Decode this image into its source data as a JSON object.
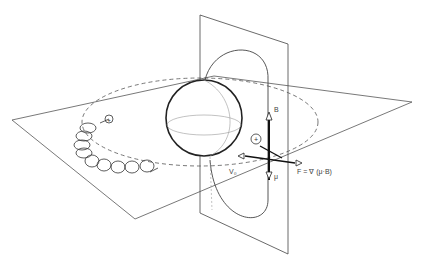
{
  "diagram": {
    "type": "magnetic-mirror-force-illustration",
    "labels": {
      "B": "B",
      "mu": "μ",
      "v0": "V₀",
      "plus_ion_1": "+",
      "plus_ion_2": "+",
      "force_equation": "F = ∇ (μ·B)"
    },
    "elements": [
      "horizontal-plane",
      "vertical-plane",
      "central-sphere",
      "dashed-orbit-ellipse",
      "magnetic-field-line-loop",
      "helical-particle-trajectory",
      "gradient-axes"
    ],
    "colors": {
      "line": "#333333",
      "light_line": "#999999",
      "background": "#ffffff"
    }
  }
}
